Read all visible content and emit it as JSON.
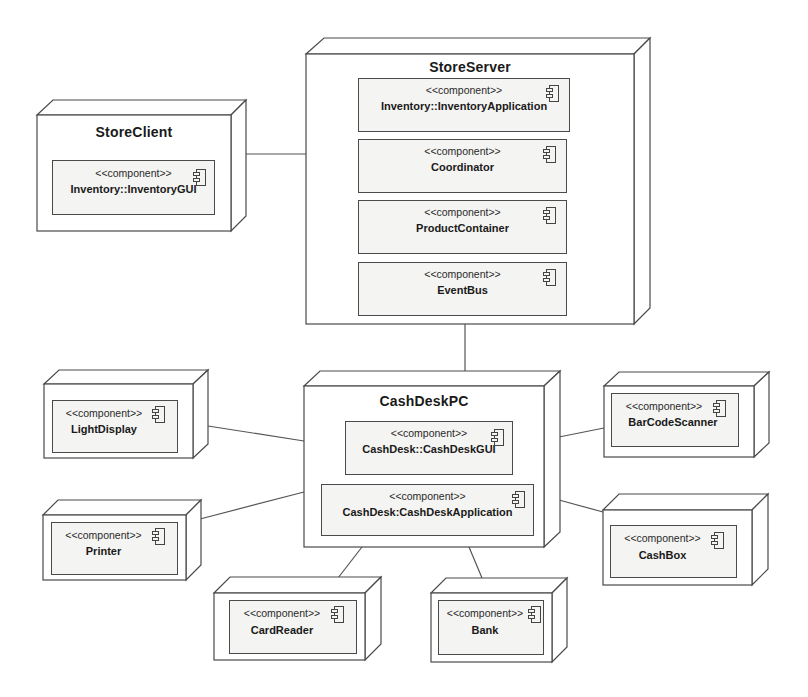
{
  "diagram": {
    "type": "UML deployment diagram",
    "stereotype": "<<component>>",
    "colors": {
      "stroke": "#4a4a4a",
      "node_fill": "#ffffff",
      "component_fill": "#f4f4f2",
      "text": "#1a1a1a"
    },
    "nodes": {
      "store_server": {
        "name": "StoreServer",
        "components": [
          {
            "stereotype": "<<component>>",
            "name": "Inventory::InventoryApplication",
            "icon": "component-icon"
          },
          {
            "stereotype": "<<component>>",
            "name": "Coordinator",
            "icon": "component-icon"
          },
          {
            "stereotype": "<<component>>",
            "name": "ProductContainer",
            "icon": "component-icon"
          },
          {
            "stereotype": "<<component>>",
            "name": "EventBus",
            "icon": "component-icon"
          }
        ]
      },
      "store_client": {
        "name": "StoreClient",
        "components": [
          {
            "stereotype": "<<component>>",
            "name": "Inventory::InventoryGUI",
            "icon": "component-icon"
          }
        ]
      },
      "cash_desk_pc": {
        "name": "CashDeskPC",
        "components": [
          {
            "stereotype": "<<component>>",
            "name": "CashDesk::CashDeskGUI",
            "icon": "component-icon"
          },
          {
            "stereotype": "<<component>>",
            "name": "CashDesk:CashDeskApplication",
            "icon": "component-icon"
          }
        ]
      },
      "light_display": {
        "components": [
          {
            "stereotype": "<<component>>",
            "name": "LightDisplay",
            "icon": "component-icon"
          }
        ]
      },
      "printer": {
        "components": [
          {
            "stereotype": "<<component>>",
            "name": "Printer",
            "icon": "component-icon"
          }
        ]
      },
      "card_reader": {
        "components": [
          {
            "stereotype": "<<component>>",
            "name": "CardReader",
            "icon": "component-icon"
          }
        ]
      },
      "bank": {
        "components": [
          {
            "stereotype": "<<component>>",
            "name": "Bank",
            "icon": "component-icon"
          }
        ]
      },
      "bar_code_scanner": {
        "components": [
          {
            "stereotype": "<<component>>",
            "name": "BarCodeScanner",
            "icon": "component-icon"
          }
        ]
      },
      "cash_box": {
        "components": [
          {
            "stereotype": "<<component>>",
            "name": "CashBox",
            "icon": "component-icon"
          }
        ]
      }
    },
    "connections": [
      {
        "from": "StoreClient",
        "to": "StoreServer"
      },
      {
        "from": "StoreServer",
        "to": "CashDeskPC"
      },
      {
        "from": "LightDisplay",
        "to": "CashDeskPC"
      },
      {
        "from": "Printer",
        "to": "CashDeskPC"
      },
      {
        "from": "CardReader",
        "to": "CashDeskPC"
      },
      {
        "from": "Bank",
        "to": "CashDeskPC"
      },
      {
        "from": "BarCodeScanner",
        "to": "CashDeskPC"
      },
      {
        "from": "CashBox",
        "to": "CashDeskPC"
      }
    ]
  }
}
